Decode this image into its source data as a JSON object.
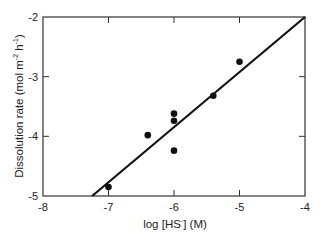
{
  "chart_data": {
    "type": "scatter",
    "title": "",
    "xlabel": "log [HS⁻] (M)",
    "ylabel": "Dissolution rate (mol m⁻² h⁻¹)",
    "xlim": [
      -8,
      -4
    ],
    "ylim": [
      -5,
      -2
    ],
    "x_ticks": [
      -8,
      -7,
      -6,
      -5,
      -4
    ],
    "y_ticks": [
      -5,
      -4,
      -3,
      -2
    ],
    "x_tick_labels": [
      "-8",
      "-7",
      "-6",
      "-5",
      "-4"
    ],
    "y_tick_labels": [
      "-5",
      "-4",
      "-3",
      "-2"
    ],
    "grid": false,
    "legend": null,
    "series": [
      {
        "name": "measured",
        "type": "scatter",
        "x": [
          -7.0,
          -6.4,
          -6.0,
          -6.0,
          -6.0,
          -5.4,
          -5.0
        ],
        "y": [
          -4.85,
          -3.98,
          -3.62,
          -3.74,
          -4.24,
          -3.32,
          -2.75
        ]
      },
      {
        "name": "fit",
        "type": "line",
        "x": [
          -7.25,
          -4.0
        ],
        "y": [
          -5.0,
          -2.0
        ]
      }
    ]
  },
  "labels": {
    "x_axis": "log [HS⁻]  (M)",
    "x_axis_main": "log [HS",
    "x_axis_sup": "-",
    "x_axis_tail": "]  (M)",
    "y_axis_main": "Dissolution rate (mol m",
    "y_axis_sup1": "-2",
    "y_axis_mid": " h",
    "y_axis_sup2": "-1",
    "y_axis_tail": ")"
  }
}
